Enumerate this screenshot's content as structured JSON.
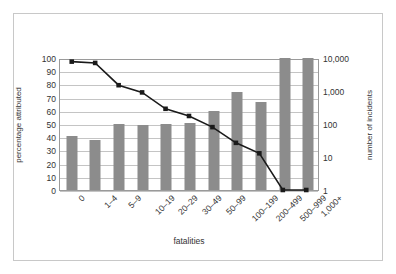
{
  "chart_data": {
    "type": "bar",
    "title": "",
    "xlabel": "fatalities",
    "ylabel": "percentage attributed",
    "y2label": "number of incidents",
    "categories": [
      "0",
      "1–4",
      "5–9",
      "10–19",
      "20–29",
      "30–49",
      "50–99",
      "100–199",
      "200–499",
      "500–999",
      "1,000+"
    ],
    "ylim": [
      0,
      100
    ],
    "yticks": [
      "0",
      "10",
      "20",
      "30",
      "40",
      "50",
      "60",
      "70",
      "80",
      "90",
      "100"
    ],
    "y2_scale": "log",
    "y2lim": [
      1,
      10000
    ],
    "y2ticks": [
      "1",
      "10",
      "100",
      "1,000",
      "10,000"
    ],
    "grid": true,
    "legend": "none",
    "series": [
      {
        "name": "percentage attributed",
        "render": "bar",
        "axis": "left",
        "color": "#8c8c8c",
        "values": [
          41,
          38,
          50,
          49,
          50,
          51,
          60,
          74,
          67,
          100,
          100
        ]
      },
      {
        "name": "number of incidents",
        "render": "line",
        "axis": "right",
        "color": "#1a1a1a",
        "marker": "square",
        "values_percent": [
          98,
          97,
          80,
          74.5,
          62,
          56.5,
          48,
          36,
          28,
          0,
          0
        ],
        "values": [
          8300,
          7400,
          1250,
          800,
          250,
          175,
          85,
          23,
          10,
          1,
          1
        ]
      }
    ]
  },
  "colors": {
    "bar": "#8c8c8c",
    "line": "#1a1a1a",
    "grid": "#c4c4c4",
    "axis": "#9a9a9a",
    "frame": "#c8c8c8",
    "text": "#333333"
  }
}
